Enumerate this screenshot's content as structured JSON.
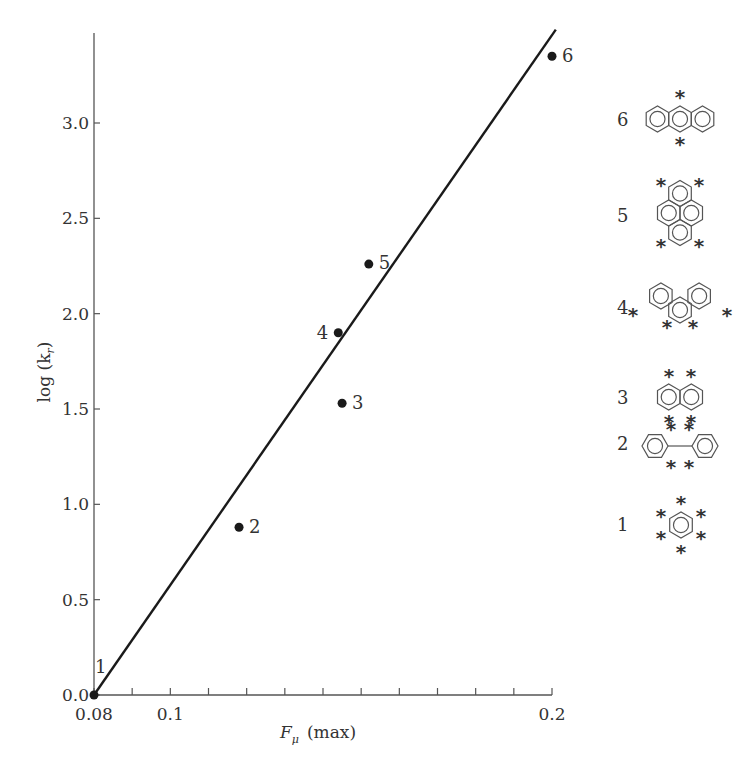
{
  "chart_data": {
    "type": "scatter",
    "title": "",
    "xlabel": "F_μ (max)",
    "xlabel_main": "F",
    "xlabel_sub": "μ",
    "xlabel_suffix": "(max)",
    "ylabel": "log (k_r)",
    "ylabel_main": "log (k",
    "ylabel_sub": "r",
    "ylabel_suffix": ")",
    "xlim": [
      0.08,
      0.2
    ],
    "ylim": [
      0.0,
      3.5
    ],
    "grid": false,
    "legend": "none",
    "x_ticks": [
      0.08,
      0.09,
      0.1,
      0.11,
      0.12,
      0.13,
      0.14,
      0.15,
      0.16,
      0.17,
      0.18,
      0.19,
      0.2
    ],
    "x_tick_labels": [
      {
        "value": 0.08,
        "label": "0.08"
      },
      {
        "value": 0.1,
        "label": "0.1"
      },
      {
        "value": 0.2,
        "label": "0.2"
      }
    ],
    "y_ticks": [
      {
        "value": 0.0,
        "label": "0.0"
      },
      {
        "value": 0.5,
        "label": "0.5"
      },
      {
        "value": 1.0,
        "label": "1.0"
      },
      {
        "value": 1.5,
        "label": "1.5"
      },
      {
        "value": 2.0,
        "label": "2.0"
      },
      {
        "value": 2.5,
        "label": "2.5"
      },
      {
        "value": 3.0,
        "label": "3.0"
      }
    ],
    "series": [
      {
        "name": "data points",
        "points": [
          {
            "id": "1",
            "x": 0.08,
            "y": 0.0
          },
          {
            "id": "2",
            "x": 0.118,
            "y": 0.88
          },
          {
            "id": "3",
            "x": 0.145,
            "y": 1.53
          },
          {
            "id": "4",
            "x": 0.144,
            "y": 1.9
          },
          {
            "id": "5",
            "x": 0.152,
            "y": 2.26
          },
          {
            "id": "6",
            "x": 0.2,
            "y": 3.35
          }
        ]
      },
      {
        "name": "fit line",
        "type": "line",
        "points": [
          {
            "x": 0.08,
            "y": 0.0
          },
          {
            "x": 0.201,
            "y": 3.49
          }
        ]
      }
    ],
    "annotations": [
      {
        "id": "6",
        "structure": "anthracene",
        "marked_positions": 2
      },
      {
        "id": "5",
        "structure": "pyrene",
        "marked_positions": 4
      },
      {
        "id": "4",
        "structure": "phenanthrene",
        "marked_positions": 4
      },
      {
        "id": "3",
        "structure": "naphthalene",
        "marked_positions": 4
      },
      {
        "id": "2",
        "structure": "biphenyl",
        "marked_positions": 4
      },
      {
        "id": "1",
        "structure": "benzene",
        "marked_positions": 6
      }
    ]
  },
  "legend_labels": {
    "m6": "6",
    "m5": "5",
    "m4": "4",
    "m3": "3",
    "m2": "2",
    "m1": "1"
  },
  "star_glyph": "*"
}
